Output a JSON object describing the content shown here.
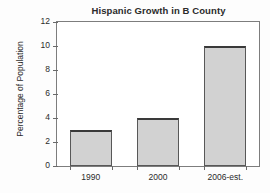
{
  "chart_data": {
    "type": "bar",
    "title": "Hispanic Growth in B County",
    "xlabel": "",
    "ylabel": "Percentage of Population",
    "categories": [
      "1990",
      "2000",
      "2006-est."
    ],
    "values": [
      3,
      4,
      10
    ],
    "ylim": [
      0,
      12
    ],
    "yticks": [
      0,
      2,
      4,
      6,
      8,
      10,
      12
    ],
    "ytick_labels": [
      "0",
      "2",
      "4",
      "6",
      "8",
      "10",
      "12"
    ],
    "grid": false,
    "legend": false,
    "series": [
      {
        "name": "Percentage of Population",
        "values": [
          3,
          4,
          10
        ]
      }
    ],
    "colors": {
      "bar_fill": "#d2d2d2",
      "bar_edge": "#585858",
      "bar_top_edge": "#3a3a3a",
      "axis": "#7d7d7d",
      "text": "#2b2b2b",
      "background": "#ffffff"
    }
  }
}
